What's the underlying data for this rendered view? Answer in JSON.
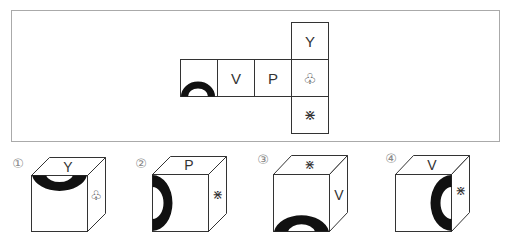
{
  "question": {
    "net": {
      "cells": [
        {
          "id": "arc-cell",
          "row": 1,
          "col": 0,
          "symbol": "half-ring-bottom",
          "label": ""
        },
        {
          "id": "v-cell",
          "row": 1,
          "col": 1,
          "symbol": "text",
          "label": "V"
        },
        {
          "id": "p-cell",
          "row": 1,
          "col": 2,
          "symbol": "text",
          "label": "P"
        },
        {
          "id": "club-cell",
          "row": 1,
          "col": 3,
          "symbol": "text",
          "label": "♧"
        },
        {
          "id": "y-cell",
          "row": 0,
          "col": 3,
          "symbol": "text",
          "label": "Y"
        },
        {
          "id": "star-cell",
          "row": 2,
          "col": 3,
          "symbol": "text",
          "label": "⋇"
        }
      ]
    }
  },
  "options": [
    {
      "number": "①",
      "top": "Y",
      "right": "♧",
      "front": "half-ring-top"
    },
    {
      "number": "②",
      "top": "P",
      "right": "⋇",
      "front": "half-ring-left"
    },
    {
      "number": "③",
      "top": "⋇",
      "right": "V",
      "front": "half-ring-bottom"
    },
    {
      "number": "④",
      "top": "V",
      "right": "⋇",
      "front": "half-ring-right"
    }
  ],
  "colors": {
    "line": "#333333",
    "frame": "#aaaaaa",
    "fill": "#111111",
    "label_gray": "#888888"
  }
}
